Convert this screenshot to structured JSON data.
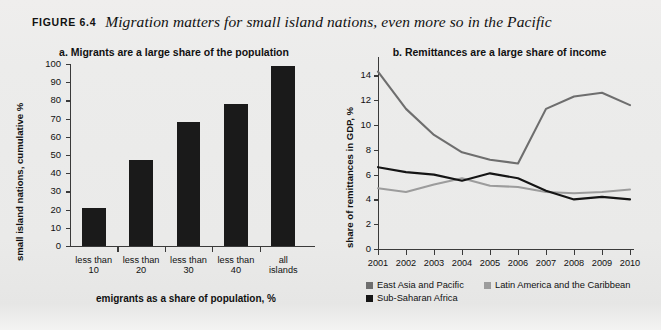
{
  "figure": {
    "tag": "FIGURE 6.4",
    "title": "Migration matters for small island nations, even more so in the Pacific"
  },
  "panel_a": {
    "title": "a. Migrants are a large share of the population",
    "ylabel": "small island nations, cumulative %",
    "xlabel": "emigrants as a share of population, %"
  },
  "panel_b": {
    "title": "b. Remittances are a large share of income",
    "ylabel": "share of remittances in GDP, %"
  },
  "colors": {
    "east_asia_pacific": "#6e6e6e",
    "latin_america_caribbean": "#9c9c9c",
    "sub_saharan_africa": "#151515",
    "bar": "#1a1a1a",
    "axis": "#3a3a3a",
    "page_background": "#ececeb"
  },
  "chart_data": [
    {
      "type": "bar",
      "panel": "a",
      "title": "a. Migrants are a large share of the population",
      "xlabel": "emigrants as a share of population, %",
      "ylabel": "small island nations, cumulative %",
      "categories": [
        "less than 10",
        "less than 20",
        "less than 30",
        "less than 40",
        "all islands"
      ],
      "category_lines": [
        [
          "less than",
          "10"
        ],
        [
          "less than",
          "20"
        ],
        [
          "less than",
          "30"
        ],
        [
          "less than",
          "40"
        ],
        [
          "all",
          "islands"
        ]
      ],
      "values": [
        21,
        47,
        68,
        78,
        99
      ],
      "ylim": [
        0,
        100
      ],
      "yticks": [
        0,
        10,
        20,
        30,
        40,
        50,
        60,
        70,
        80,
        90,
        100
      ],
      "grid": false,
      "legend": "none"
    },
    {
      "type": "line",
      "panel": "b",
      "title": "b. Remittances are a large share of income",
      "xlabel": "",
      "ylabel": "share of remittances in GDP, %",
      "x": [
        2001,
        2002,
        2003,
        2004,
        2005,
        2006,
        2007,
        2008,
        2009,
        2010
      ],
      "ylim": [
        0,
        15
      ],
      "yticks": [
        0,
        2,
        4,
        6,
        8,
        10,
        12,
        14
      ],
      "grid": false,
      "legend": "below-axis",
      "series": [
        {
          "name": "East Asia and Pacific",
          "color": "#6e6e6e",
          "values": [
            14.3,
            11.3,
            9.2,
            7.8,
            7.2,
            6.9,
            11.3,
            12.3,
            12.6,
            11.6
          ]
        },
        {
          "name": "Latin America and the Caribbean",
          "color": "#9c9c9c",
          "values": [
            4.9,
            4.6,
            5.2,
            5.7,
            5.1,
            5.0,
            4.6,
            4.5,
            4.6,
            4.8
          ]
        },
        {
          "name": "Sub-Saharan Africa",
          "color": "#151515",
          "values": [
            6.6,
            6.2,
            6.0,
            5.5,
            6.1,
            5.7,
            4.7,
            4.0,
            4.2,
            4.0
          ]
        }
      ]
    }
  ],
  "legend": {
    "items": [
      {
        "label": "East Asia and Pacific",
        "color": "#6e6e6e"
      },
      {
        "label": "Latin America and the Caribbean",
        "color": "#9c9c9c"
      },
      {
        "label": "Sub-Saharan Africa",
        "color": "#151515"
      }
    ]
  }
}
